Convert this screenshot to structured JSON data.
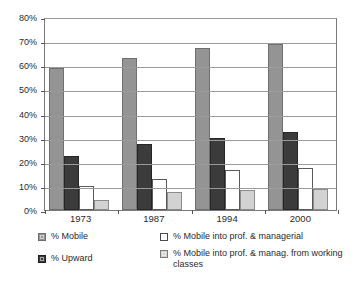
{
  "chart_data": {
    "type": "bar",
    "title": "",
    "xlabel": "",
    "ylabel": "",
    "ylim": [
      0,
      80
    ],
    "ytick_labels": [
      "0%",
      "10%",
      "20%",
      "30%",
      "40%",
      "50%",
      "60%",
      "70%",
      "80%"
    ],
    "ytick_values": [
      0,
      10,
      20,
      30,
      40,
      50,
      60,
      70,
      80
    ],
    "grid": true,
    "legend_position": "bottom",
    "categories": [
      "1973",
      "1987",
      "1994",
      "2000"
    ],
    "series": [
      {
        "name": "% Mobile",
        "color": "#949494",
        "values": [
          59,
          63,
          67,
          69
        ]
      },
      {
        "name": "% Upward",
        "color": "#3b3b3b",
        "values": [
          22.5,
          27.5,
          30,
          32.5
        ]
      },
      {
        "name": "% Mobile into prof. & managerial",
        "color": "#ffffff",
        "values": [
          9.8,
          13,
          16.5,
          17.5
        ]
      },
      {
        "name": "% Mobile into prof. & manag. from working classes",
        "color": "#d2d2d2",
        "values": [
          4,
          7.3,
          8.5,
          8.6
        ]
      }
    ]
  },
  "legend": {
    "left_column": [
      {
        "label": "% Mobile",
        "swatch": "s0"
      },
      {
        "label": "% Upward",
        "swatch": "s1"
      }
    ],
    "right_column": [
      {
        "label": "% Mobile into prof. & managerial",
        "swatch": "s2"
      },
      {
        "label": "% Mobile into prof. & manag. from working classes",
        "swatch": "s3"
      }
    ]
  }
}
